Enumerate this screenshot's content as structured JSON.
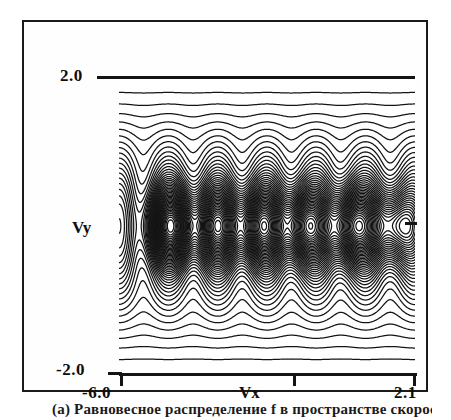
{
  "figure": {
    "caption": "(a) Равновесное распределение f в пространстве скоростей",
    "axes": {
      "x_label": "Vx",
      "y_label": "Vy",
      "x_min_label": "-6.0",
      "x_max_label": "2.1",
      "y_min_label": "-2.0",
      "y_max_label": "2.0"
    },
    "ink_color": "#141414",
    "background_color": "#ffffff"
  },
  "chart_data": {
    "type": "line",
    "plot_kind": "contour",
    "title": "",
    "subtitle": "",
    "xlabel": "Vx",
    "ylabel": "Vy",
    "xlim": [
      -6.0,
      2.1
    ],
    "ylim": [
      -2.0,
      2.0
    ],
    "xticks": [
      -6.0,
      -1.95,
      2.1
    ],
    "xtick_labels": [
      "-6.0",
      "",
      "2.1"
    ],
    "yticks": [
      -2.0,
      0.0,
      2.0
    ],
    "ytick_labels": [
      "-2.0",
      "",
      "2.0"
    ],
    "grid": false,
    "legend": null,
    "contour_levels": 46,
    "contour_line_color": "#141414",
    "contour_fill": "none",
    "maxima": [
      {
        "vx": -4.55,
        "vy": 0.0,
        "rank": 1
      },
      {
        "vx": -3.3,
        "vy": 0.0,
        "rank": 4
      },
      {
        "vx": -2.15,
        "vy": 0.0,
        "rank": 3
      },
      {
        "vx": -0.95,
        "vy": 0.0,
        "rank": 2
      },
      {
        "vx": 0.35,
        "vy": 0.0,
        "rank": 1
      },
      {
        "vx": 1.55,
        "vy": 0.0,
        "rank": 5
      }
    ],
    "band_boundaries": {
      "upper_wave_band_vy": [
        0.55,
        2.0
      ],
      "central_island_band_vy": [
        -0.55,
        0.55
      ],
      "lower_wave_band_vy": [
        -2.0,
        -0.55
      ]
    },
    "wave_number_x": 6,
    "series": [
      {
        "name": "contour levels",
        "values": [
          0.02,
          0.04,
          0.06,
          0.08,
          0.1,
          0.12,
          0.14,
          0.16,
          0.18,
          0.2,
          0.22,
          0.24,
          0.26,
          0.28,
          0.3,
          0.32,
          0.34,
          0.36,
          0.38,
          0.4,
          0.42,
          0.44,
          0.46,
          0.48,
          0.5,
          0.52,
          0.54,
          0.56,
          0.58,
          0.6,
          0.62,
          0.64,
          0.66,
          0.68,
          0.7,
          0.72,
          0.74,
          0.76,
          0.78,
          0.8,
          0.82,
          0.84,
          0.86,
          0.88,
          0.9,
          0.92
        ]
      }
    ]
  }
}
